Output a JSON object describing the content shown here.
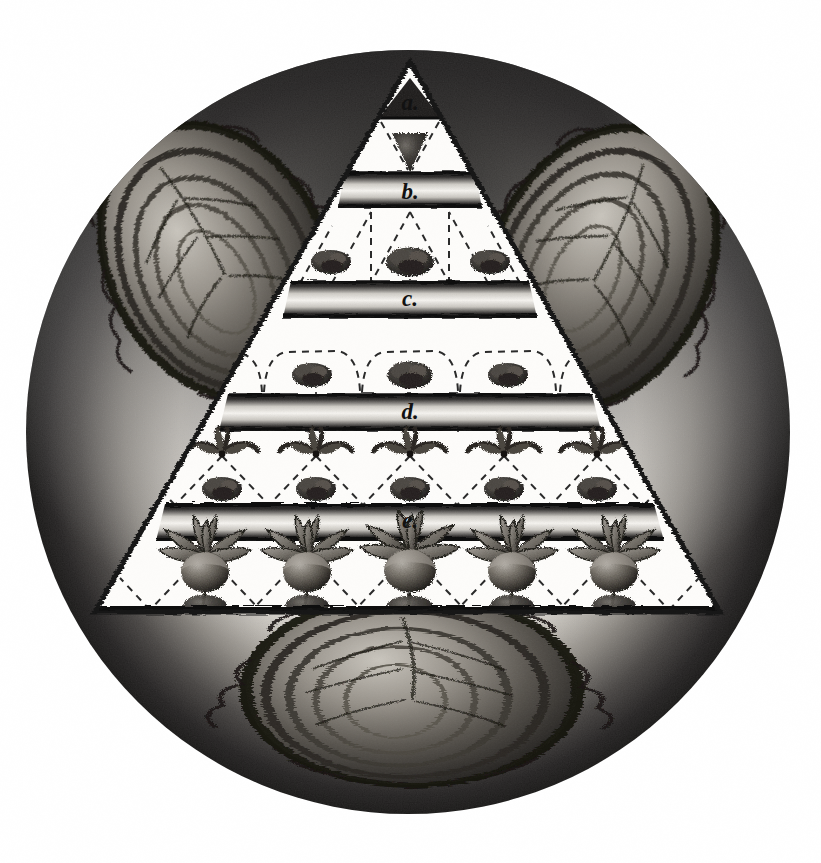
{
  "plate": {
    "title": "Engraved circular plate: germination pyramid with cabbages",
    "shape": "circular vignette containing an equilateral triangle diagram",
    "medium": "antique stipple / mezzotint engraving, monochrome",
    "background_color": "#ffffff",
    "ink_color": "#1a1a1a",
    "paper_tone": "#f4f2ee"
  },
  "circle": {
    "name": "outer-vignette-circle",
    "center_x": 408,
    "center_y": 432,
    "radius": 382,
    "vignette_dark": "#2b2b2b",
    "vignette_light": "#e8e6e1"
  },
  "pyramid": {
    "name": "central-triangle",
    "apex_x": 410,
    "apex_y": 62,
    "base_left_x": 95,
    "base_right_x": 720,
    "base_y": 612,
    "fill": "#ffffff",
    "stroke": "#151515"
  },
  "bands": [
    {
      "id": "a",
      "label": "a.",
      "label_x": 410,
      "label_y": 103,
      "y_top": 78,
      "y_bottom": 118,
      "kind": "apex-triangle-band",
      "description": "small dark triangle at the apex containing the letter a"
    },
    {
      "id": "b",
      "label": "b.",
      "label_x": 410,
      "label_y": 196,
      "y_top": 172,
      "y_bottom": 208,
      "kind": "horizontal-soil-band",
      "description": "dark soil stratum band labelled b"
    },
    {
      "id": "c",
      "label": "c.",
      "label_x": 410,
      "label_y": 300,
      "y_top": 281,
      "y_bottom": 318,
      "kind": "horizontal-soil-band",
      "description": "dark soil stratum band labelled c"
    },
    {
      "id": "d",
      "label": "d.",
      "label_x": 410,
      "label_y": 414,
      "y_top": 394,
      "y_bottom": 431,
      "kind": "horizontal-soil-band",
      "description": "dark soil stratum band labelled d"
    },
    {
      "id": "e",
      "label": "e.",
      "label_x": 410,
      "label_y": 523,
      "y_top": 504,
      "y_bottom": 541,
      "kind": "horizontal-soil-band",
      "description": "dark soil stratum band labelled e"
    }
  ],
  "rows": [
    {
      "name": "row-apex-funnel",
      "between": "a-b",
      "items": 1,
      "item_kind": "inverted-cone-seed",
      "positions": [
        410
      ],
      "center_y": 152,
      "description": "single dark inverted cone / funnel of seed below band a"
    },
    {
      "name": "row-seed-clumps-upper",
      "between": "b-c",
      "items": 3,
      "item_kind": "seed-clump",
      "positions": [
        331,
        410,
        490
      ],
      "center_y": 262,
      "description": "three dark rounded seed clumps with dashed V guides"
    },
    {
      "name": "row-seed-clumps-middle",
      "between": "c-d",
      "items": 3,
      "item_kind": "seed-clump",
      "positions": [
        312,
        410,
        508
      ],
      "center_y": 375,
      "description": "three seed clumps under dashed trapezoidal canopy guides"
    },
    {
      "name": "row-sprouts",
      "between": "d-e",
      "items": 5,
      "item_kind": "sprout-and-clump",
      "positions": [
        222,
        316,
        410,
        504,
        597
      ],
      "sprout_y": 446,
      "clump_y": 489,
      "description": "five small three-leaf sprouts above five seed clumps, dashed V guides"
    },
    {
      "name": "row-mature-roots",
      "between": "e-base",
      "items": 5,
      "item_kind": "mature-root-plant",
      "positions": [
        205,
        307,
        410,
        512,
        614
      ],
      "center_y": 575,
      "description": "five mature turnip/radish root plants with leaf rosettes and taproots"
    }
  ],
  "vegetables": [
    {
      "name": "cabbage-left",
      "cx": 218,
      "cy": 262,
      "rx": 112,
      "ry": 150,
      "rotate": -28,
      "description": "large savoy cabbage head, left of the pyramid"
    },
    {
      "name": "cabbage-right",
      "cx": 600,
      "cy": 268,
      "rx": 112,
      "ry": 152,
      "rotate": 26,
      "description": "large savoy cabbage head, right of the pyramid"
    },
    {
      "name": "cabbage-bottom",
      "cx": 412,
      "cy": 690,
      "rx": 168,
      "ry": 92,
      "rotate": 0,
      "description": "broad leafy cabbage / lettuce head at the base of the circle"
    }
  ],
  "guides": {
    "name": "dashed-projection-lines",
    "stroke": "#2a2a2a",
    "dash": "7 6",
    "width": 2.0,
    "description": "dashed V and trapezoid guide lines linking each stratum to the stage below"
  },
  "legend_letters": [
    "a.",
    "b.",
    "c.",
    "d.",
    "e."
  ]
}
